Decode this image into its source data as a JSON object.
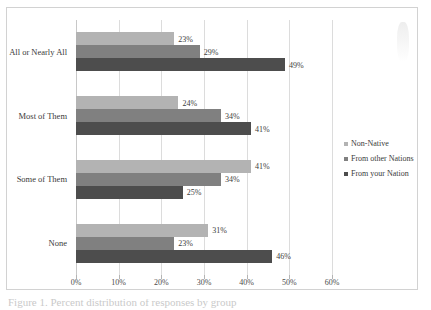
{
  "chart_data": {
    "type": "bar",
    "orientation": "horizontal",
    "title": "",
    "xlabel": "",
    "ylabel": "",
    "xlim": [
      0,
      60
    ],
    "xticks": [
      "0%",
      "10%",
      "20%",
      "30%",
      "40%",
      "50%",
      "60%"
    ],
    "xtick_values": [
      0,
      10,
      20,
      30,
      40,
      50,
      60
    ],
    "grid": true,
    "legend_position": "right",
    "categories": [
      "All or Nearly All",
      "Most of Them",
      "Some of Them",
      "None"
    ],
    "series": [
      {
        "name": "Non-Native",
        "color": "#b3b3b3",
        "values": [
          23,
          24,
          41,
          31
        ],
        "labels": [
          "23%",
          "24%",
          "41%",
          "31%"
        ]
      },
      {
        "name": "From other Nations",
        "color": "#808080",
        "values": [
          29,
          34,
          34,
          23
        ],
        "labels": [
          "29%",
          "34%",
          "34%",
          "23%"
        ]
      },
      {
        "name": "From your Nation",
        "color": "#4d4d4d",
        "values": [
          49,
          41,
          25,
          46
        ],
        "labels": [
          "49%",
          "41%",
          "25%",
          "46%"
        ]
      }
    ]
  },
  "legend": {
    "items": [
      {
        "label": "Non-Native",
        "color": "#b3b3b3"
      },
      {
        "label": "From other Nations",
        "color": "#808080"
      },
      {
        "label": "From your Nation",
        "color": "#4d4d4d"
      }
    ]
  },
  "caption": {
    "text": "Figure 1. Percent distribution of responses by group"
  }
}
